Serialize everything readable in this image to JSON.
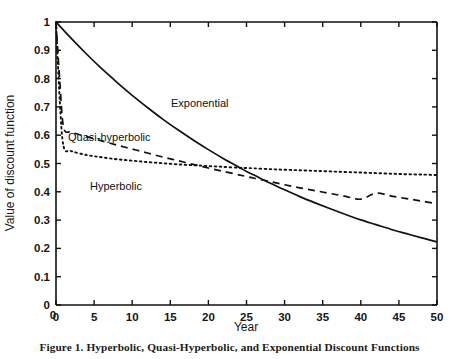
{
  "figure": {
    "caption": "Figure 1.  Hyperbolic, Quasi-Hyperbolic, and Exponential Discount Functions"
  },
  "axes": {
    "xlabel": "Year",
    "ylabel": "Value of discount function",
    "x_ticks": [
      "0",
      "5",
      "10",
      "15",
      "20",
      "25",
      "30",
      "35",
      "40",
      "45",
      "50"
    ],
    "y_ticks": [
      "0",
      "0.1",
      "0.2",
      "0.3",
      "0.4",
      "0.5",
      "0.6",
      "0.7",
      "0.8",
      "0.9",
      "1"
    ],
    "y_zero_label": "0"
  },
  "annotations": {
    "exponential": "Exponential",
    "quasi_hyperbolic": "Quasi-hyperbolic",
    "hyperbolic": "Hyperbolic"
  },
  "chart_data": {
    "type": "line",
    "title": "Figure 1.  Hyperbolic, Quasi-Hyperbolic, and Exponential Discount Functions",
    "xlabel": "Year",
    "ylabel": "Value of discount function",
    "xlim": [
      0,
      50
    ],
    "ylim": [
      0,
      1
    ],
    "xticks": [
      0,
      5,
      10,
      15,
      20,
      25,
      30,
      35,
      40,
      45,
      50
    ],
    "yticks": [
      0,
      0.1,
      0.2,
      0.3,
      0.4,
      0.5,
      0.6,
      0.7,
      0.8,
      0.9,
      1
    ],
    "grid": false,
    "legend": "none (curves labelled inline)",
    "line_color": "#111111",
    "series": [
      {
        "name": "Exponential",
        "style": "solid",
        "x": [
          0,
          2,
          4,
          6,
          8,
          10,
          12,
          14,
          16,
          18,
          20,
          22,
          24,
          25,
          26,
          28,
          30,
          32,
          34,
          36,
          38,
          40,
          42,
          44,
          46,
          48,
          50
        ],
        "values": [
          1.0,
          0.942,
          0.887,
          0.835,
          0.787,
          0.741,
          0.698,
          0.657,
          0.619,
          0.583,
          0.549,
          0.517,
          0.487,
          0.472,
          0.459,
          0.432,
          0.407,
          0.383,
          0.361,
          0.34,
          0.32,
          0.301,
          0.284,
          0.267,
          0.252,
          0.237,
          0.223
        ]
      },
      {
        "name": "Quasi-hyperbolic",
        "style": "dashed",
        "x": [
          0,
          0.5,
          1,
          2,
          4,
          6,
          8,
          10,
          12,
          14,
          16,
          18,
          20,
          22,
          24,
          25,
          26,
          28,
          30,
          32,
          34,
          36,
          38,
          40,
          42,
          44,
          46,
          48,
          50
        ],
        "values": [
          1.0,
          0.79,
          0.628,
          0.611,
          0.595,
          0.58,
          0.565,
          0.551,
          0.537,
          0.523,
          0.51,
          0.497,
          0.484,
          0.472,
          0.46,
          0.454,
          0.448,
          0.437,
          0.425,
          0.414,
          0.404,
          0.394,
          0.384,
          0.374,
          0.395,
          0.385,
          0.376,
          0.367,
          0.358
        ]
      },
      {
        "name": "Hyperbolic",
        "style": "dotted",
        "x": [
          0,
          0.5,
          1,
          2,
          4,
          6,
          8,
          10,
          12,
          14,
          16,
          18,
          20,
          22,
          24,
          25,
          26,
          28,
          30,
          32,
          34,
          36,
          38,
          40,
          42,
          44,
          46,
          48,
          50
        ],
        "values": [
          1.0,
          0.72,
          0.56,
          0.544,
          0.53,
          0.522,
          0.515,
          0.51,
          0.505,
          0.501,
          0.497,
          0.494,
          0.491,
          0.488,
          0.485,
          0.484,
          0.483,
          0.48,
          0.478,
          0.476,
          0.474,
          0.472,
          0.47,
          0.468,
          0.466,
          0.464,
          0.462,
          0.461,
          0.459
        ]
      }
    ],
    "annotations": [
      {
        "text": "Exponential",
        "x": 17,
        "y": 0.7
      },
      {
        "text": "Quasi-hyperbolic",
        "x": 2.5,
        "y": 0.595
      },
      {
        "text": "Hyperbolic",
        "x": 10,
        "y": 0.455
      }
    ]
  }
}
